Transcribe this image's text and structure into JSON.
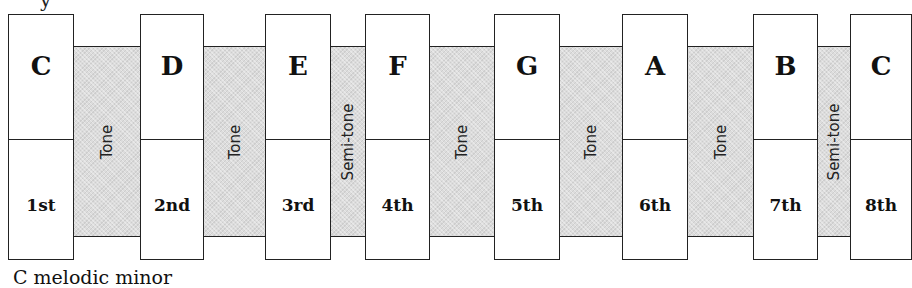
{
  "diagram": {
    "top_text_clipped": "y",
    "caption": "C melodic minor",
    "notes": [
      {
        "name": "C",
        "degree": "1st",
        "left": 8,
        "width": 66
      },
      {
        "name": "D",
        "degree": "2nd",
        "left": 140,
        "width": 64
      },
      {
        "name": "E",
        "degree": "3rd",
        "left": 265,
        "width": 66
      },
      {
        "name": "F",
        "degree": "4th",
        "left": 365,
        "width": 65
      },
      {
        "name": "G",
        "degree": "5th",
        "left": 494,
        "width": 66
      },
      {
        "name": "A",
        "degree": "6th",
        "left": 622,
        "width": 66
      },
      {
        "name": "B",
        "degree": "7th",
        "left": 753,
        "width": 65
      },
      {
        "name": "C",
        "degree": "8th",
        "left": 850,
        "width": 62
      }
    ],
    "intervals": [
      {
        "label": "Tone",
        "left": 74,
        "width": 66
      },
      {
        "label": "Tone",
        "left": 204,
        "width": 61
      },
      {
        "label": "Semi-tone",
        "left": 331,
        "width": 34
      },
      {
        "label": "Tone",
        "left": 430,
        "width": 64
      },
      {
        "label": "Tone",
        "left": 560,
        "width": 62
      },
      {
        "label": "Tone",
        "left": 688,
        "width": 65
      },
      {
        "label": "Semi-tone",
        "left": 818,
        "width": 32
      }
    ],
    "colors": {
      "band": "#dcdcdc",
      "box": "#ffffff",
      "stroke": "#222222"
    }
  }
}
